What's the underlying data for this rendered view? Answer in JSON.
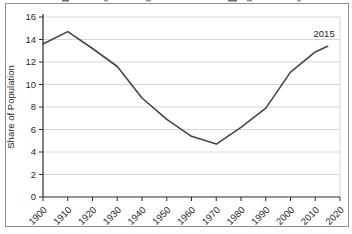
{
  "window": {
    "background": "#ffffff",
    "frame_border_color": "#8f8f8f"
  },
  "chart_data": {
    "type": "line",
    "title": "",
    "xlabel": "",
    "ylabel": "Share of Population",
    "xlim": [
      1900,
      2020
    ],
    "ylim": [
      0,
      16
    ],
    "x_ticks": [
      1900,
      1910,
      1920,
      1930,
      1940,
      1950,
      1960,
      1970,
      1980,
      1990,
      2000,
      2010,
      2020
    ],
    "y_ticks": [
      0,
      2,
      4,
      6,
      8,
      10,
      12,
      14,
      16
    ],
    "grid": "horizontal",
    "legend": "none",
    "line_color": "#454545",
    "grid_color": "#d6d6d6",
    "axis_color": "#2b2b2b",
    "series": [
      {
        "name": "Share of Population",
        "points": [
          [
            1900,
            13.6
          ],
          [
            1910,
            14.7
          ],
          [
            1920,
            13.2
          ],
          [
            1930,
            11.6
          ],
          [
            1940,
            8.8
          ],
          [
            1950,
            6.9
          ],
          [
            1960,
            5.4
          ],
          [
            1970,
            4.7
          ],
          [
            1980,
            6.2
          ],
          [
            1990,
            7.9
          ],
          [
            2000,
            11.1
          ],
          [
            2010,
            12.9
          ],
          [
            2015,
            13.4
          ]
        ]
      }
    ],
    "annotations": [
      {
        "text": "2015",
        "year": 2015,
        "value": 13.4
      }
    ]
  }
}
